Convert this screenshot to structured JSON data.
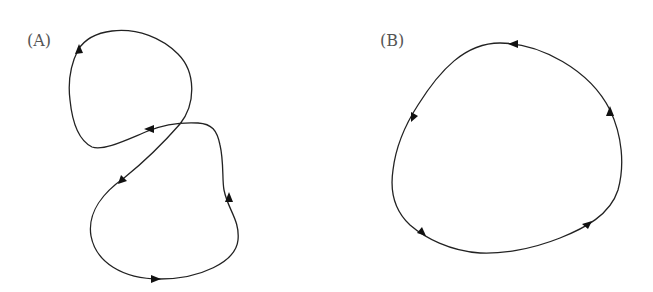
{
  "panels": [
    {
      "id": "A",
      "label": "(A)",
      "description": "figure-eight closed trajectory with arrows"
    },
    {
      "id": "B",
      "label": "(B)",
      "description": "simple closed loop with counter-clockwise arrows"
    }
  ],
  "colors": {
    "stroke": "#222222",
    "label": "#555555",
    "background": "#ffffff"
  }
}
